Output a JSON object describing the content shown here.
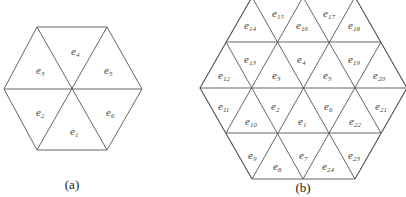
{
  "figure_a": {
    "caption": "(a)",
    "elements": [
      {
        "id": "e4",
        "base": "e",
        "sub": "4",
        "x": 71,
        "y": 55
      },
      {
        "id": "e3",
        "base": "e",
        "sub": "3",
        "x": 36,
        "y": 74
      },
      {
        "id": "e5",
        "base": "e",
        "sub": "5",
        "x": 104,
        "y": 74
      },
      {
        "id": "e2",
        "base": "e",
        "sub": "2",
        "x": 36,
        "y": 116
      },
      {
        "id": "e6",
        "base": "e",
        "sub": "6",
        "x": 106,
        "y": 116
      },
      {
        "id": "e1",
        "base": "e",
        "sub": "1",
        "x": 70,
        "y": 135
      }
    ]
  },
  "figure_b": {
    "caption": "(b)",
    "elements": [
      {
        "id": "e14",
        "base": "e",
        "sub": "14",
        "x": 244,
        "y": 29
      },
      {
        "id": "e15",
        "base": "e",
        "sub": "15",
        "x": 272,
        "y": 17
      },
      {
        "id": "e16",
        "base": "e",
        "sub": "16",
        "x": 296,
        "y": 29
      },
      {
        "id": "e17",
        "base": "e",
        "sub": "17",
        "x": 323,
        "y": 17
      },
      {
        "id": "e18",
        "base": "e",
        "sub": "18",
        "x": 348,
        "y": 29
      },
      {
        "id": "e12",
        "base": "e",
        "sub": "12",
        "x": 218,
        "y": 79
      },
      {
        "id": "e13",
        "base": "e",
        "sub": "13",
        "x": 244,
        "y": 63
      },
      {
        "id": "e3",
        "base": "e",
        "sub": "3",
        "x": 272,
        "y": 79
      },
      {
        "id": "e4",
        "base": "e",
        "sub": "4",
        "x": 297,
        "y": 63
      },
      {
        "id": "e5",
        "base": "e",
        "sub": "5",
        "x": 323,
        "y": 79
      },
      {
        "id": "e19",
        "base": "e",
        "sub": "19",
        "x": 348,
        "y": 63
      },
      {
        "id": "e20",
        "base": "e",
        "sub": "20",
        "x": 373,
        "y": 79
      },
      {
        "id": "e11",
        "base": "e",
        "sub": "11",
        "x": 218,
        "y": 110
      },
      {
        "id": "e10",
        "base": "e",
        "sub": "10",
        "x": 245,
        "y": 125
      },
      {
        "id": "e2",
        "base": "e",
        "sub": "2",
        "x": 271,
        "y": 110
      },
      {
        "id": "e1",
        "base": "e",
        "sub": "1",
        "x": 298,
        "y": 125
      },
      {
        "id": "e6",
        "base": "e",
        "sub": "6",
        "x": 324,
        "y": 110
      },
      {
        "id": "e22",
        "base": "e",
        "sub": "22",
        "x": 349,
        "y": 125
      },
      {
        "id": "e21",
        "base": "e",
        "sub": "21",
        "x": 375,
        "y": 110
      },
      {
        "id": "e9",
        "base": "e",
        "sub": "9",
        "x": 248,
        "y": 159
      },
      {
        "id": "e8",
        "base": "e",
        "sub": "8",
        "x": 273,
        "y": 170
      },
      {
        "id": "e7",
        "base": "e",
        "sub": "7",
        "x": 299,
        "y": 159
      },
      {
        "id": "e24",
        "base": "e",
        "sub": "24",
        "x": 322,
        "y": 170
      },
      {
        "id": "e23",
        "base": "e",
        "sub": "23",
        "x": 348,
        "y": 159
      }
    ]
  }
}
